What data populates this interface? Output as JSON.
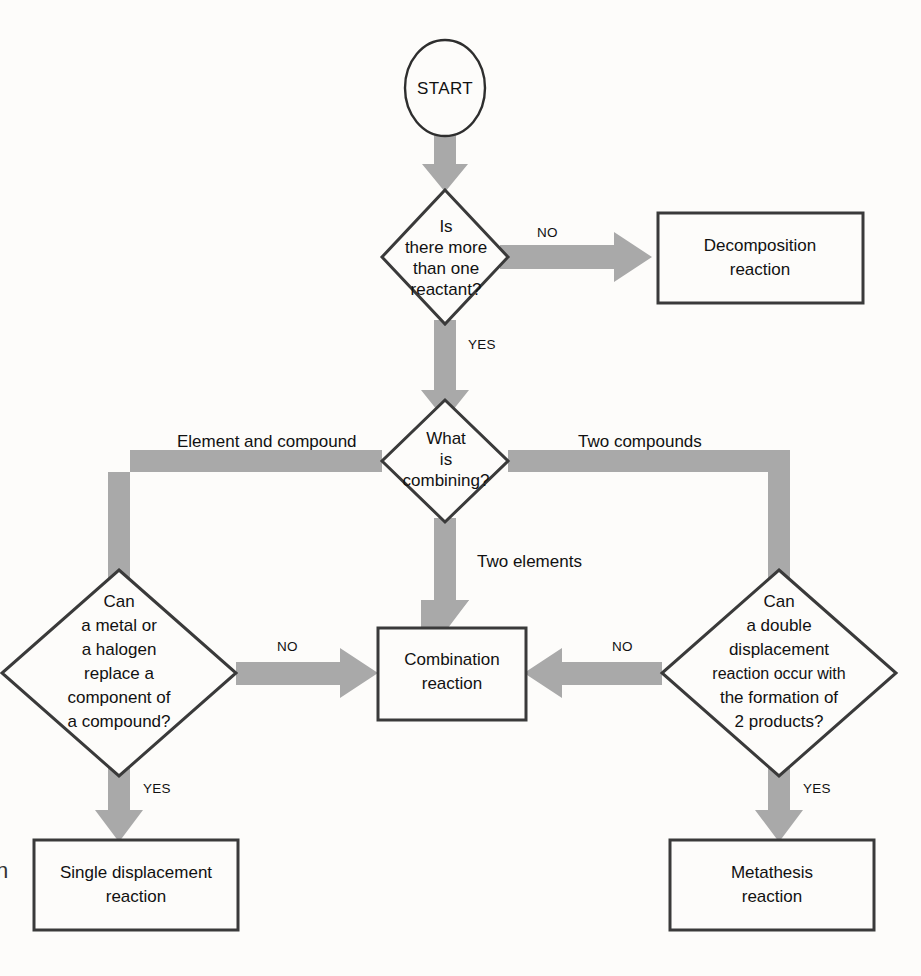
{
  "diagram": {
    "colors": {
      "background": "#fdfcfa",
      "arrow_gray": "#a9a9a9",
      "outline": "#3a3a3a",
      "text": "#111111"
    },
    "margin_glyph": "n"
  },
  "nodes": {
    "start": {
      "id": "start",
      "shape": "circle",
      "label": "START"
    },
    "d1": {
      "id": "is-there-more-than-one-reactant",
      "shape": "diamond",
      "lines": [
        "Is",
        "there more",
        "than one",
        "reactant?"
      ]
    },
    "d2": {
      "id": "what-is-combining",
      "shape": "diamond",
      "lines": [
        "What",
        "is",
        "combining?"
      ]
    },
    "d3": {
      "id": "can-a-metal-or-halogen-replace",
      "shape": "diamond",
      "lines": [
        "Can",
        "a metal or",
        "a halogen",
        "replace a",
        "component of",
        "a compound?"
      ]
    },
    "d4": {
      "id": "can-a-double-displacement-occur",
      "shape": "diamond",
      "lines": [
        "Can",
        "a double",
        "displacement",
        "reaction occur with",
        "the formation of",
        "2 products?"
      ]
    },
    "b_decomposition": {
      "id": "decomposition-reaction",
      "shape": "rect",
      "lines": [
        "Decomposition",
        "reaction"
      ]
    },
    "b_combination": {
      "id": "combination-reaction",
      "shape": "rect",
      "lines": [
        "Combination",
        "reaction"
      ]
    },
    "b_single": {
      "id": "single-displacement-reaction",
      "shape": "rect",
      "lines": [
        "Single displacement",
        "reaction"
      ]
    },
    "b_metathesis": {
      "id": "metathesis-reaction",
      "shape": "rect",
      "lines": [
        "Metathesis",
        "reaction"
      ]
    }
  },
  "edges": {
    "start_to_d1": {
      "label": ""
    },
    "d1_no": {
      "label": "NO",
      "from": "is-there-more-than-one-reactant",
      "to": "decomposition-reaction"
    },
    "d1_yes": {
      "label": "YES",
      "from": "is-there-more-than-one-reactant",
      "to": "what-is-combining"
    },
    "d2_left": {
      "label": "Element and compound",
      "from": "what-is-combining",
      "to": "can-a-metal-or-halogen-replace"
    },
    "d2_down": {
      "label": "Two elements",
      "from": "what-is-combining",
      "to": "combination-reaction"
    },
    "d2_right": {
      "label": "Two compounds",
      "from": "what-is-combining",
      "to": "can-a-double-displacement-occur"
    },
    "d3_no": {
      "label": "NO",
      "from": "can-a-metal-or-halogen-replace",
      "to": "combination-reaction"
    },
    "d3_yes": {
      "label": "YES",
      "from": "can-a-metal-or-halogen-replace",
      "to": "single-displacement-reaction"
    },
    "d4_no": {
      "label": "NO",
      "from": "can-a-double-displacement-occur",
      "to": "combination-reaction"
    },
    "d4_yes": {
      "label": "YES",
      "from": "can-a-double-displacement-occur",
      "to": "metathesis-reaction"
    }
  }
}
